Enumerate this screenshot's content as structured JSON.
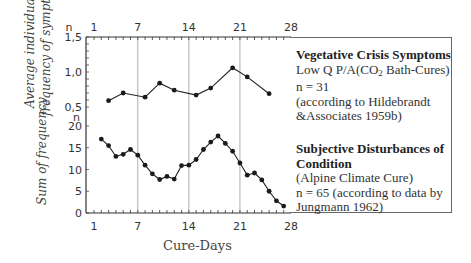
{
  "chart_data": [
    {
      "type": "line",
      "panel": "upper",
      "title": "Vegetative Crisis Symptoms",
      "subtitle": "Low Q P/A(CO2 Bath-Cures)",
      "n_label": "n = 31",
      "source": "(according to Hildebrandt &Associates 1959b)",
      "xlabel": "Cure-Days",
      "ylabel": "Average individual frequency of symptoms",
      "ylim": [
        0.5,
        1.5
      ],
      "yticks": [
        "1,5",
        "1,0",
        "0,5"
      ],
      "xticks": [
        1,
        7,
        14,
        21,
        28
      ],
      "xlim": [
        0,
        28
      ],
      "grid": "vertical lines at days 7, 14, 21",
      "x": [
        3,
        5,
        8,
        10,
        12,
        15,
        17,
        20,
        22,
        25
      ],
      "values": [
        0.59,
        0.7,
        0.64,
        0.84,
        0.74,
        0.67,
        0.77,
        1.06,
        0.93,
        0.69
      ]
    },
    {
      "type": "line",
      "panel": "lower",
      "title": "Subjective Disturbances of Condition",
      "subtitle": "(Alpine Climate Cure)",
      "n_label": "n = 65 (according to data by Jungmann 1962)",
      "xlabel": "Cure-Days",
      "ylabel": "Sum of frequency",
      "ylim": [
        0,
        20
      ],
      "yticks": [
        "20",
        "15",
        "10",
        "5",
        "0"
      ],
      "xticks": [
        1,
        7,
        14,
        21,
        28
      ],
      "xlim": [
        0,
        28
      ],
      "grid": "vertical lines at days 7, 14, 21",
      "x": [
        2,
        3,
        4,
        5,
        6,
        7,
        8,
        9,
        10,
        11,
        12,
        13,
        14,
        15,
        16,
        17,
        18,
        19,
        20,
        21,
        22,
        23,
        24,
        25,
        26,
        27
      ],
      "values": [
        17,
        15.5,
        13,
        13.5,
        14.6,
        13.3,
        11,
        9,
        7.7,
        8.4,
        7.8,
        10.9,
        11,
        12.3,
        14.6,
        16.3,
        17.7,
        16,
        14.2,
        11.5,
        8.7,
        9.2,
        7.6,
        5,
        2.8,
        1.6
      ]
    }
  ],
  "axes": {
    "n_label": "n",
    "top_ticks": [
      "1",
      "7",
      "14",
      "21",
      "28"
    ],
    "bottom_ticks": [
      "1",
      "7",
      "14",
      "21",
      "28"
    ],
    "upper_yticks": [
      "1,5",
      "1,0",
      "0,5"
    ],
    "lower_yticks": [
      "20",
      "15",
      "10",
      "5",
      "0"
    ],
    "upper_ylabel_line1": "Average individual",
    "upper_ylabel_line2": "frequency of symptoms",
    "lower_ylabel": "Sum of frequency",
    "xlabel": "Cure-Days"
  },
  "legend": {
    "upper": {
      "title": "Vegetative Crisis Symptoms",
      "line1_pre": "Low Q P/A(CO",
      "line1_sub": "2",
      "line1_post": " Bath-Cures)",
      "line2": "n = 31",
      "line3": "(according to Hildebrandt",
      "line4": "&Associates 1959b)"
    },
    "lower": {
      "title_line1": "Subjective Disturbances of",
      "title_line2": "Condition",
      "line1": "(Alpine Climate Cure)",
      "line2": "n = 65 (according to data by",
      "line3": "Jungmann 1962)"
    }
  },
  "colors": {
    "line": "#222222",
    "marker": "#1a1a1a",
    "grid": "#999999",
    "axis": "#333333"
  }
}
